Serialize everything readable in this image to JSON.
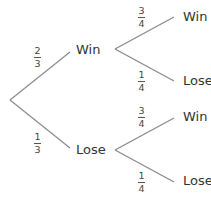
{
  "diagram": {
    "type": "probability-tree",
    "root": {
      "branches": [
        {
          "label": "Win",
          "probability": {
            "num": "2",
            "den": "3"
          },
          "children": [
            {
              "label": "Win",
              "probability": {
                "num": "3",
                "den": "4"
              }
            },
            {
              "label": "Lose",
              "probability": {
                "num": "1",
                "den": "4"
              }
            }
          ]
        },
        {
          "label": "Lose",
          "probability": {
            "num": "1",
            "den": "3"
          },
          "children": [
            {
              "label": "Win",
              "probability": {
                "num": "3",
                "den": "4"
              }
            },
            {
              "label": "Lose",
              "probability": {
                "num": "1",
                "den": "4"
              }
            }
          ]
        }
      ]
    },
    "colors": {
      "line": "#8a8a8a",
      "text": "#333333",
      "background": "#ffffff"
    }
  }
}
